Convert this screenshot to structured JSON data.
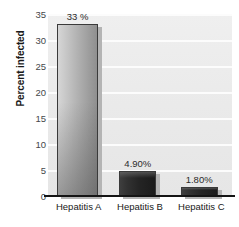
{
  "chart_data": {
    "type": "bar",
    "title": "",
    "xlabel": "",
    "ylabel": "Percent infected",
    "categories": [
      "Hepatitis A",
      "Hepatitis B",
      "Hepatitis C"
    ],
    "values": [
      33,
      4.9,
      1.8
    ],
    "data_labels": [
      "33 %",
      "4.90%",
      "1.80%"
    ],
    "ylim": [
      0,
      35
    ],
    "ytick_labels": [
      "35",
      "30",
      "25",
      "20",
      "15",
      "10",
      "5",
      "0"
    ],
    "ytick_values": [
      35,
      30,
      25,
      20,
      15,
      10,
      5,
      0
    ],
    "grid": true,
    "legend": "none",
    "colors": {
      "plot_background": "#eaeaea",
      "gridline": "#fcfcfc",
      "bar_tall": "#b3b3b3",
      "bar_short": "#242424",
      "bar_outline": "#3a3a3a",
      "bar_shadow": "#b4b4b4",
      "axis_line": "#141414",
      "tick_text": "#44474a",
      "label_text": "#202020"
    }
  }
}
